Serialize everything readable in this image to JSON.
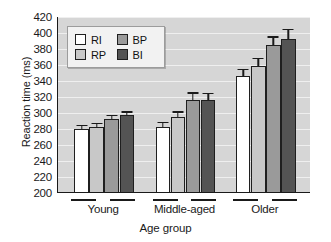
{
  "chart_data": {
    "type": "bar",
    "title": "",
    "xlabel": "Age group",
    "ylabel": "Reaction time (ms)",
    "categories": [
      "Young",
      "Middle-aged",
      "Older"
    ],
    "ylim": [
      200,
      420
    ],
    "ytick_step": 20,
    "yticks": [
      200,
      220,
      240,
      260,
      280,
      300,
      320,
      340,
      360,
      380,
      400,
      420
    ],
    "grid": true,
    "legend_position": "upper-left-inside",
    "series": [
      {
        "name": "RI",
        "color": "#ffffff",
        "values": [
          280,
          283,
          346
        ],
        "errors": [
          5,
          6,
          9
        ]
      },
      {
        "name": "RP",
        "color": "#c8c8c8",
        "values": [
          283,
          295,
          359
        ],
        "errors": [
          5,
          7,
          10
        ]
      },
      {
        "name": "BP",
        "color": "#9a9a9a",
        "values": [
          293,
          316,
          385
        ],
        "errors": [
          5,
          10,
          11
        ]
      },
      {
        "name": "BI",
        "color": "#545454",
        "values": [
          297,
          316,
          393
        ],
        "errors": [
          5,
          9,
          12
        ]
      }
    ]
  },
  "legend": {
    "entries": [
      {
        "label": "RI",
        "color": "#ffffff"
      },
      {
        "label": "BP",
        "color": "#9a9a9a"
      },
      {
        "label": "RP",
        "color": "#c8c8c8"
      },
      {
        "label": "BI",
        "color": "#545454"
      }
    ]
  },
  "colors": {
    "plot_background": "#d6d6d6",
    "gridline": "#efefef",
    "axis": "#1a1a1a",
    "legend_background": "#f2f2f2",
    "figure_background": "#ffffff"
  }
}
